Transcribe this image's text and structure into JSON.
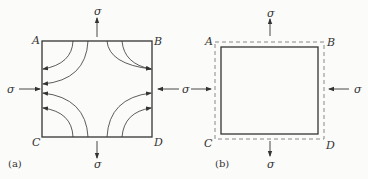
{
  "panel_a": {
    "caption": "(a)",
    "corners": {
      "A": "A",
      "B": "B",
      "C": "C",
      "D": "D"
    },
    "stress": {
      "top": "σ",
      "bottom": "σ",
      "left": "σ",
      "right": "σ"
    },
    "description": "Square with curved stress flow lines from top/bottom edges to left/right edges"
  },
  "panel_b": {
    "caption": "(b)",
    "corners": {
      "A": "A",
      "B": "B",
      "C": "C",
      "D": "D"
    },
    "stress": {
      "top": "σ",
      "bottom": "σ",
      "left": "σ",
      "right": "σ"
    },
    "description": "Original square (dashed) and deformed square (solid), elongated vertically, compressed horizontally"
  },
  "colors": {
    "line": "#333333",
    "dashed": "#888888",
    "background": "#fbfbfa"
  }
}
